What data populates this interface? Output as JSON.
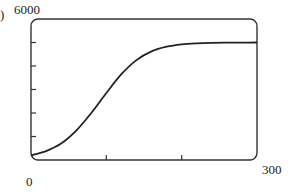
{
  "chart_data": {
    "type": "line",
    "title": "",
    "xlabel": "",
    "ylabel": "",
    "xlim": [
      0,
      300
    ],
    "ylim": [
      0,
      6000
    ],
    "x_tick_labels": [
      "0",
      "300"
    ],
    "y_tick_labels": [
      "6000"
    ],
    "x_ticks": [
      0,
      100,
      200,
      300
    ],
    "y_ticks": [
      0,
      1000,
      2000,
      3000,
      4000,
      5000,
      6000
    ],
    "grid": false,
    "legend": null,
    "series": [
      {
        "name": "logistic curve",
        "x": [
          0,
          20,
          40,
          60,
          80,
          100,
          120,
          140,
          160,
          180,
          200,
          220,
          240,
          260,
          280,
          300
        ],
        "values": [
          200,
          380,
          700,
          1250,
          2000,
          2850,
          3650,
          4250,
          4620,
          4820,
          4920,
          4965,
          4985,
          4993,
          4997,
          5000
        ]
      }
    ]
  },
  "labels": {
    "y_max": "6000",
    "x_min": "0",
    "x_max": "300",
    "panel_marker": ")"
  }
}
